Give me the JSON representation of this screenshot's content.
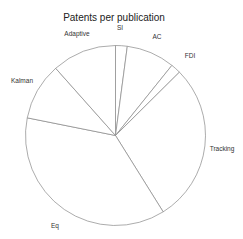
{
  "chart_data": {
    "type": "pie",
    "title": "Patents per publication",
    "categories": [
      "SI",
      "AC",
      "FDI",
      "Tracking",
      "Eq",
      "Kalman",
      "Adaptive"
    ],
    "values": [
      2.1,
      8.7,
      1.8,
      28.6,
      37.1,
      10.3,
      11.6
    ],
    "units": "percent (estimated from slice angles)",
    "start_angle_deg": 90,
    "direction": "clockwise",
    "fill": "#ffffff",
    "stroke": "#888888",
    "legend": "none (direct slice labels)"
  },
  "labels": {
    "title": "Patents per publication",
    "si": "SI",
    "ac": "AC",
    "fdi": "FDI",
    "tracking": "Tracking",
    "eq": "Eq",
    "kalman": "Kalman",
    "adaptive": "Adaptive"
  }
}
